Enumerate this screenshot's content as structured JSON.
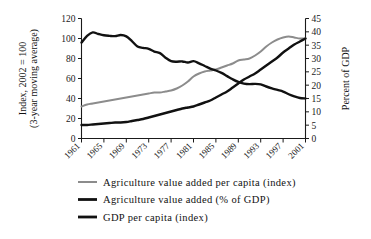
{
  "chart_data": {
    "type": "line",
    "title": "",
    "subtitle": "",
    "xlabel": "",
    "ylabel": "Index, 2002 = 100",
    "ylabel_line2": "(3-year moving average)",
    "y2label": "Percent of GDP",
    "ylim": [
      0,
      120
    ],
    "y2lim": [
      0,
      45
    ],
    "xlim": [
      1961,
      2001
    ],
    "grid": false,
    "legend_position": "below",
    "yticks": [
      0,
      20,
      40,
      60,
      80,
      100,
      120
    ],
    "y2ticks": [
      0,
      5,
      10,
      15,
      20,
      25,
      30,
      35,
      40,
      45
    ],
    "xticks": [
      1961,
      1965,
      1969,
      1973,
      1977,
      1981,
      1985,
      1989,
      1993,
      1997,
      2001
    ],
    "x": [
      1961,
      1962,
      1963,
      1964,
      1965,
      1966,
      1967,
      1968,
      1969,
      1970,
      1971,
      1972,
      1973,
      1974,
      1975,
      1976,
      1977,
      1978,
      1979,
      1980,
      1981,
      1982,
      1983,
      1984,
      1985,
      1986,
      1987,
      1988,
      1989,
      1990,
      1991,
      1992,
      1993,
      1994,
      1995,
      1996,
      1997,
      1998,
      1999,
      2000,
      2001
    ],
    "series": [
      {
        "name": "Agriculture value added per capita (index)",
        "axis": "left",
        "unit": "index",
        "color": "#8c8c8c",
        "linewidth": 2.0,
        "values": [
          32,
          34,
          35,
          36,
          37,
          38,
          39,
          40,
          41,
          42,
          43,
          44,
          45,
          46,
          46,
          47,
          48,
          50,
          53,
          57,
          62,
          65,
          67,
          68,
          69,
          71,
          73,
          75,
          78,
          79,
          80,
          83,
          87,
          92,
          96,
          99,
          101,
          102,
          101,
          100,
          100
        ]
      },
      {
        "name": "Agriculture value added (% of GDP)",
        "axis": "right",
        "unit": "percent",
        "color": "#111111",
        "linewidth": 2.4,
        "values": [
          36,
          38.5,
          39.8,
          39.2,
          38.7,
          38.5,
          38.4,
          38.8,
          38.3,
          36.5,
          34.5,
          34.0,
          33.6,
          32.6,
          32.0,
          30.3,
          29.0,
          28.8,
          28.9,
          28.5,
          29.0,
          28.2,
          27.2,
          26.2,
          25.5,
          24.6,
          23.4,
          22.2,
          21.2,
          20.6,
          20.4,
          20.5,
          20.3,
          19.5,
          18.8,
          18.2,
          17.6,
          16.6,
          15.8,
          15.2,
          15.0
        ]
      },
      {
        "name": "GDP per capita (index)",
        "axis": "left",
        "unit": "index",
        "color": "#111111",
        "linewidth": 2.4,
        "values": [
          13.5,
          13.5,
          14,
          14.5,
          15,
          15.5,
          16,
          16,
          16.5,
          17.5,
          18.5,
          19.5,
          21,
          22.5,
          24,
          25.5,
          27,
          28.5,
          30,
          31,
          32,
          34,
          36,
          38,
          41,
          44,
          47,
          51,
          55,
          59,
          62,
          65,
          69,
          73,
          77,
          81,
          86,
          90,
          94,
          97,
          100
        ]
      }
    ]
  },
  "legend": {
    "items": [
      {
        "label": "Agriculture value added per capita (index)",
        "color": "#8c8c8c",
        "thickness": 2.0
      },
      {
        "label": "Agriculture value added (% of GDP)",
        "color": "#111111",
        "thickness": 2.8
      },
      {
        "label": "GDP per capita (index)",
        "color": "#111111",
        "thickness": 2.8
      }
    ]
  },
  "axes": {
    "left_title_line1": "Index, 2002 = 100",
    "left_title_line2": "(3-year moving average)",
    "right_title": "Percent of GDP",
    "left_ticks": [
      "0",
      "20",
      "40",
      "60",
      "80",
      "100",
      "120"
    ],
    "right_ticks": [
      "0",
      "5",
      "10",
      "15",
      "20",
      "25",
      "30",
      "35",
      "40",
      "45"
    ],
    "x_ticks": [
      "1961",
      "1965",
      "1969",
      "1973",
      "1977",
      "1981",
      "1985",
      "1989",
      "1993",
      "1997",
      "2001"
    ]
  }
}
